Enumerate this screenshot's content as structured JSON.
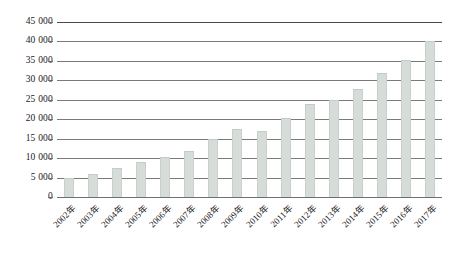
{
  "chart_data": {
    "type": "bar",
    "title": "",
    "xlabel": "",
    "ylabel": "",
    "grid": true,
    "legend": "none",
    "ylim": [
      0,
      45000
    ],
    "ytick_step": 5000,
    "ytick_labels": [
      "0",
      "5 000",
      "10 000",
      "15 000",
      "20 000",
      "25 000",
      "30 000",
      "35 000",
      "40 000",
      "45 000"
    ],
    "ytick_values": [
      0,
      5000,
      10000,
      15000,
      20000,
      25000,
      30000,
      35000,
      40000,
      45000
    ],
    "categories": [
      "2002年",
      "2003年",
      "2004年",
      "2005年",
      "2006年",
      "2007年",
      "2008年",
      "2009年",
      "2010年",
      "2011年",
      "2012年",
      "2013年",
      "2014年",
      "2015年",
      "2016年",
      "2017年"
    ],
    "values": [
      5000,
      6000,
      7500,
      9000,
      10200,
      11900,
      15000,
      17400,
      16900,
      20300,
      23900,
      25000,
      27700,
      32000,
      35300,
      40200
    ],
    "colors": {
      "bar_fill": "#d6dcd8",
      "bar_border": "#c9d0cb",
      "gridline": "#7a7a7a",
      "axis_text": "#1a1a1a",
      "background": "#ffffff"
    }
  }
}
